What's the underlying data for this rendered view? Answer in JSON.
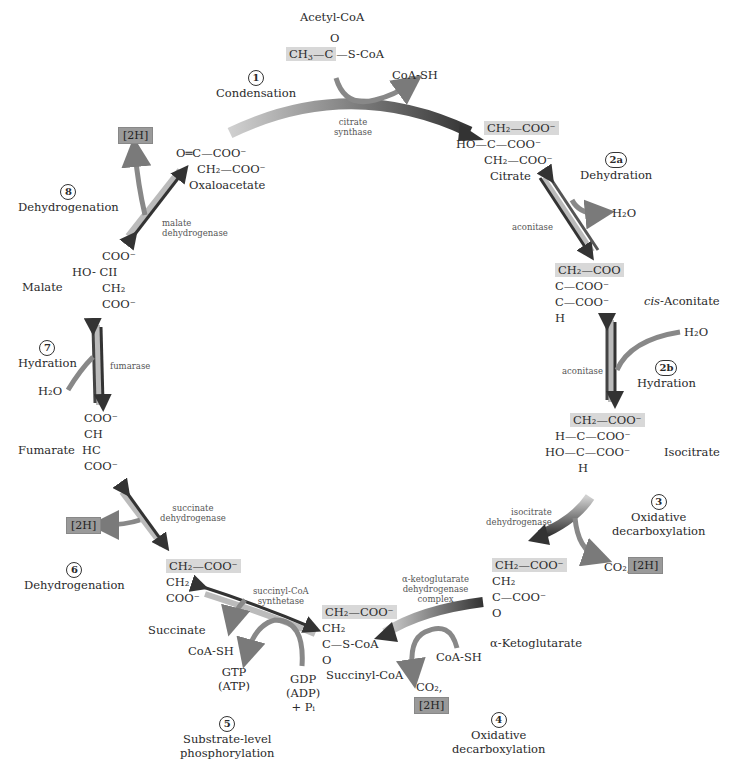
{
  "colors": {
    "arrow_dark": "#3a3a3a",
    "arrow_light": "#b8b8b8",
    "side_arrow": "#7a7a7a",
    "highlight": "#d8d8d8",
    "box_2h": "#9a9a9a"
  },
  "steps": [
    {
      "num": "1",
      "name": "Condensation",
      "enzyme": [
        "citrate",
        "synthase"
      ]
    },
    {
      "num": "2a",
      "name": "Dehydration",
      "enzyme": [
        "aconitase"
      ]
    },
    {
      "num": "2b",
      "name": "Hydration",
      "enzyme": [
        "aconitase"
      ]
    },
    {
      "num": "3",
      "name": [
        "Oxidative",
        "decarboxylation"
      ],
      "enzyme": [
        "isocitrate",
        "dehydrogenase"
      ]
    },
    {
      "num": "4",
      "name": [
        "Oxidative",
        "decarboxylation"
      ],
      "enzyme": [
        "α-ketoglutarate",
        "dehydrogenase",
        "complex"
      ]
    },
    {
      "num": "5",
      "name": [
        "Substrate-level",
        "phosphorylation"
      ],
      "enzyme": [
        "succinyl-CoA",
        "synthetase"
      ]
    },
    {
      "num": "6",
      "name": "Dehydrogenation",
      "enzyme": [
        "succinate",
        "dehydrogenase"
      ]
    },
    {
      "num": "7",
      "name": "Hydration",
      "enzyme": [
        "fumarase"
      ]
    },
    {
      "num": "8",
      "name": "Dehydrogenation",
      "enzyme": [
        "malate",
        "dehydrogenase"
      ]
    }
  ],
  "molecules": {
    "acetyl_coa": {
      "name": "Acetyl-CoA",
      "l1": "O",
      "l2a": "CH",
      "l2b": "—C—S-CoA"
    },
    "oxaloacetate": {
      "name": "Oxaloacetate",
      "l1": "O═C—COO⁻",
      "l2": "CH₂—COO⁻"
    },
    "citrate": {
      "name": "Citrate",
      "l1": "CH₂—COO⁻",
      "l2": "HO—C—COO⁻",
      "l3": "CH₂—COO⁻"
    },
    "cis_aconitate": {
      "name": "-Aconitate",
      "prefix": "cis",
      "l1": "CH₂—COO",
      "l2": "C—COO⁻",
      "l3": "C—COO⁻",
      "l4": "H"
    },
    "isocitrate": {
      "name": "Isocitrate",
      "l1": "CH₂—COO⁻",
      "l2": "H—C—COO⁻",
      "l3": "HO—C—COO⁻",
      "l4": "H"
    },
    "alpha_ketoglutarate": {
      "name": "α-Ketoglutarate",
      "l1": "CH₂—COO⁻",
      "l2": "CH₂",
      "l3": "C—COO⁻",
      "l4": "O"
    },
    "succinyl_coa": {
      "name": "Succinyl-CoA",
      "l1": "CH₂—COO⁻",
      "l2": "CH₂",
      "l3": "C—S-CoA",
      "l4": "O"
    },
    "succinate": {
      "name": "Succinate",
      "l1": "CH₂—COO⁻",
      "l2": "CH₂",
      "l3": "COO⁻"
    },
    "fumarate": {
      "name": "Fumarate",
      "l1": "COO⁻",
      "l2": "CH",
      "l3": "HC",
      "l4": "COO⁻"
    },
    "malate": {
      "name": "Malate",
      "l1": "COO⁻",
      "l2a": "HO-",
      "l2b": "CII",
      "l3": "CH₂",
      "l4": "COO⁻"
    }
  },
  "side_products": {
    "coa_sh_1": "CoA-SH",
    "h2o_2a": "H₂O",
    "h2o_2b": "H₂O",
    "co2_3": "CO₂,",
    "h2_3": "[2H]",
    "coa_sh_4": "CoA-SH",
    "co2_4": "CO₂,",
    "h2_4": "[2H]",
    "coa_sh_5": "CoA-SH",
    "gtp": "GTP",
    "atp": "(ATP)",
    "gdp": "GDP",
    "adp": "(ADP)",
    "pi": "+ Pᵢ",
    "h2_6": "[2H]",
    "h2o_7": "H₂O",
    "h2_8": "[2H]"
  }
}
